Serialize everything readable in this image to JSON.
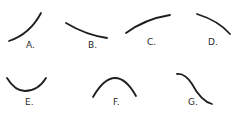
{
  "figure": {
    "stroke_color": "#1e1e1e",
    "curves": [
      {
        "label": "A.",
        "shape": "increasing, concave down"
      },
      {
        "label": "B.",
        "shape": "decreasing, concave up"
      },
      {
        "label": "C.",
        "shape": "increasing, concave down"
      },
      {
        "label": "D.",
        "shape": "decreasing, concave down"
      },
      {
        "label": "E.",
        "shape": "U-shaped minimum"
      },
      {
        "label": "F.",
        "shape": "arch-shaped maximum"
      },
      {
        "label": "G.",
        "shape": "S-shaped decreasing"
      }
    ]
  }
}
